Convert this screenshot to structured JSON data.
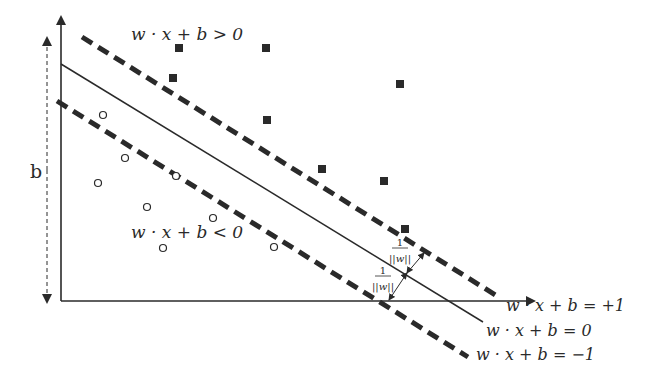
{
  "diagram": {
    "colors": {
      "ink": "#2a2a2a",
      "background": "#ffffff"
    },
    "axes": {
      "origin": [
        61,
        301
      ],
      "x_end": [
        534,
        301
      ],
      "y_end": [
        61,
        17
      ]
    },
    "bias_arrow": {
      "label": "b",
      "x": 47,
      "y_top": 38,
      "y_bottom": 302
    },
    "lines": {
      "hyperplane": {
        "label": "w · x + b = 0",
        "from": [
          61,
          64
        ],
        "to": [
          483,
          322
        ],
        "style": "solid"
      },
      "positive_margin": {
        "label": "w · x + b = +1",
        "from": [
          82,
          37
        ],
        "to": [
          497,
          296
        ],
        "style": "dashed"
      },
      "negative_margin": {
        "label": "w · x + b = −1",
        "from": [
          57,
          101
        ],
        "to": [
          468,
          357
        ],
        "style": "dashed"
      }
    },
    "region_labels": {
      "positive": "w · x + b > 0",
      "negative": "w · x + b < 0"
    },
    "margin_annotation": {
      "numerator": "1",
      "denominator": "||w||",
      "upper": {
        "label_pos": [
          400,
          252
        ],
        "arrow_from": [
          407,
          273
        ],
        "arrow_to": [
          424,
          253
        ]
      },
      "lower": {
        "label_pos": [
          383,
          280
        ],
        "arrow_from": [
          407,
          273
        ],
        "arrow_to": [
          389,
          300
        ]
      }
    },
    "positive_points": [
      [
        179,
        48
      ],
      [
        266,
        48
      ],
      [
        173,
        78
      ],
      [
        267,
        120
      ],
      [
        400,
        84
      ],
      [
        322,
        169
      ],
      [
        384,
        181
      ],
      [
        405,
        229
      ]
    ],
    "negative_points": [
      [
        103,
        115
      ],
      [
        125,
        158
      ],
      [
        98,
        183
      ],
      [
        176,
        176
      ],
      [
        147,
        207
      ],
      [
        213,
        218
      ],
      [
        163,
        248
      ],
      [
        274,
        247
      ]
    ]
  }
}
